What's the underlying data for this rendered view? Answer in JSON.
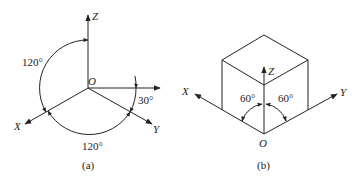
{
  "figure_a": {
    "caption": "(a)",
    "origin_label": "O",
    "axes": {
      "x": "X",
      "y": "Y",
      "z": "Z"
    },
    "angles": {
      "xz": "120°",
      "xy": "120°",
      "horizontal_y": "30°"
    }
  },
  "figure_b": {
    "caption": "(b)",
    "origin_label": "O",
    "axes": {
      "x": "X",
      "y": "Y",
      "z": "Z"
    },
    "angles": {
      "left": "60°",
      "right": "60°"
    }
  }
}
